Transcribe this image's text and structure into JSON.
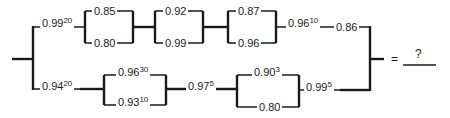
{
  "components": {
    "top_series_first": {
      "base": "0.99",
      "exp": "20"
    },
    "top_parallel_1": {
      "upper": "0.85",
      "lower": "0.80"
    },
    "top_parallel_2": {
      "upper": "0.92",
      "lower": "0.99"
    },
    "top_parallel_3": {
      "upper": "0.87",
      "lower": "0.96"
    },
    "top_series_after": {
      "base": "0.96",
      "exp": "10"
    },
    "top_series_last": {
      "base": "0.86",
      "exp": ""
    },
    "bottom_series_first": {
      "base": "0.94",
      "exp": "20"
    },
    "bottom_parallel_1": {
      "upper": {
        "base": "0.96",
        "exp": "30"
      },
      "lower": {
        "base": "0.93",
        "exp": "10"
      }
    },
    "bottom_series_mid": {
      "base": "0.97",
      "exp": "5"
    },
    "bottom_parallel_2": {
      "upper": {
        "base": "0.90",
        "exp": "3"
      },
      "lower": {
        "base": "0.80",
        "exp": ""
      }
    },
    "bottom_series_last": {
      "base": "0.99",
      "exp": "5"
    }
  },
  "result": {
    "equals": "=",
    "answer": "?"
  }
}
